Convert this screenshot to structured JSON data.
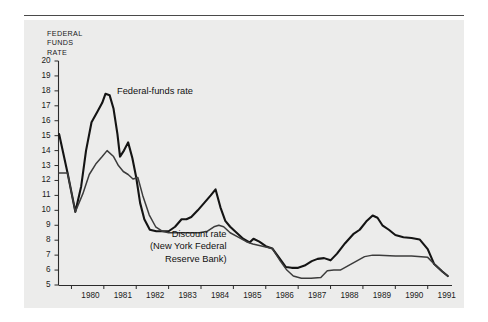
{
  "figure": {
    "background": "#ffffff",
    "plate_background": "#ececeb",
    "rule_color": "#4a4a4a"
  },
  "axis_title": "FEDERAL\nFUNDS\nRATE",
  "annotations": {
    "federal_funds": "Federal-funds rate",
    "discount": "Discount rate\n(New York Federal\nReserve Bank)"
  },
  "chart_data": {
    "type": "line",
    "title": "FEDERAL FUNDS RATE",
    "xlabel": "",
    "ylabel": "FEDERAL FUNDS RATE",
    "xlim": [
      1979.6,
      1991.75
    ],
    "ylim": [
      5,
      20
    ],
    "grid": false,
    "legend": "inline-annotations",
    "ytick_labels": [
      "20",
      "19",
      "18",
      "17",
      "16",
      "15",
      "14",
      "13",
      "12",
      "11",
      "10",
      "9",
      "8",
      "7",
      "6",
      "5"
    ],
    "ytick_values": [
      20,
      19,
      18,
      17,
      16,
      15,
      14,
      13,
      12,
      11,
      10,
      9,
      8,
      7,
      6,
      5
    ],
    "xtick_labels": [
      "1980",
      "1981",
      "1982",
      "1983",
      "1984",
      "1985",
      "1986",
      "1987",
      "1988",
      "1989",
      "1990",
      "1991"
    ],
    "xtick_values": [
      1980,
      1981,
      1982,
      1983,
      1984,
      1985,
      1986,
      1987,
      1988,
      1989,
      1990,
      1991
    ],
    "series": [
      {
        "name": "Federal-funds rate",
        "color": "#141414",
        "width": 2.1,
        "x": [
          1979.62,
          1979.88,
          1980.12,
          1980.3,
          1980.45,
          1980.62,
          1980.8,
          1980.95,
          1981.05,
          1981.18,
          1981.3,
          1981.42,
          1981.5,
          1981.62,
          1981.75,
          1981.88,
          1982.0,
          1982.12,
          1982.25,
          1982.42,
          1982.62,
          1982.8,
          1983.0,
          1983.2,
          1983.4,
          1983.55,
          1983.7,
          1983.9,
          1984.1,
          1984.3,
          1984.45,
          1984.6,
          1984.75,
          1984.9,
          1985.1,
          1985.3,
          1985.5,
          1985.62,
          1985.8,
          1986.0,
          1986.2,
          1986.42,
          1986.62,
          1986.8,
          1987.0,
          1987.2,
          1987.42,
          1987.6,
          1987.8,
          1988.0,
          1988.2,
          1988.45,
          1988.7,
          1988.9,
          1989.1,
          1989.3,
          1989.45,
          1989.6,
          1989.8,
          1990.0,
          1990.25,
          1990.5,
          1990.75,
          1991.0,
          1991.2,
          1991.45,
          1991.62
        ],
        "y": [
          15.1,
          12.5,
          9.9,
          11.6,
          14.0,
          15.9,
          16.6,
          17.2,
          17.8,
          17.7,
          16.8,
          15.1,
          13.6,
          14.0,
          14.55,
          13.5,
          12.2,
          10.5,
          9.4,
          8.7,
          8.6,
          8.6,
          8.6,
          8.9,
          9.4,
          9.4,
          9.55,
          10.0,
          10.5,
          11.0,
          11.4,
          10.2,
          9.3,
          8.9,
          8.5,
          8.1,
          7.85,
          8.1,
          7.9,
          7.6,
          7.45,
          6.8,
          6.2,
          6.15,
          6.15,
          6.3,
          6.6,
          6.75,
          6.8,
          6.65,
          7.1,
          7.8,
          8.4,
          8.7,
          9.25,
          9.65,
          9.5,
          9.0,
          8.7,
          8.35,
          8.2,
          8.15,
          8.05,
          7.4,
          6.4,
          5.9,
          5.6
        ]
      },
      {
        "name": "Discount rate (New York Federal Reserve Bank)",
        "color": "#3c3c3c",
        "width": 1.5,
        "x": [
          1979.62,
          1979.88,
          1980.12,
          1980.35,
          1980.55,
          1980.75,
          1980.95,
          1981.1,
          1981.3,
          1981.45,
          1981.6,
          1981.75,
          1981.9,
          1982.05,
          1982.2,
          1982.4,
          1982.6,
          1982.8,
          1983.0,
          1983.4,
          1983.75,
          1983.95,
          1984.2,
          1984.4,
          1984.55,
          1984.7,
          1984.9,
          1985.15,
          1985.4,
          1985.6,
          1985.8,
          1986.0,
          1986.2,
          1986.45,
          1986.65,
          1986.85,
          1987.1,
          1987.4,
          1987.7,
          1987.9,
          1988.1,
          1988.3,
          1988.55,
          1988.8,
          1989.05,
          1989.3,
          1989.5,
          1990.0,
          1990.5,
          1991.0,
          1991.2,
          1991.45,
          1991.62
        ],
        "y": [
          12.5,
          12.5,
          9.9,
          11.1,
          12.4,
          13.1,
          13.6,
          14.0,
          13.6,
          13.0,
          12.6,
          12.4,
          12.1,
          12.2,
          11.0,
          9.7,
          8.9,
          8.6,
          8.5,
          8.5,
          8.5,
          8.5,
          8.6,
          8.9,
          9.0,
          8.9,
          8.5,
          8.2,
          7.9,
          7.75,
          7.65,
          7.55,
          7.45,
          6.6,
          6.0,
          5.6,
          5.45,
          5.45,
          5.5,
          5.95,
          6.0,
          6.0,
          6.3,
          6.6,
          6.9,
          7.0,
          7.0,
          6.95,
          6.95,
          6.85,
          6.4,
          5.9,
          5.6
        ]
      }
    ]
  }
}
